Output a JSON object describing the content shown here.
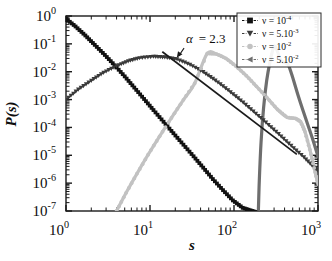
{
  "chart_data": {
    "type": "line",
    "title": "",
    "xlabel": "s",
    "ylabel": "P(s)",
    "xscale": "log",
    "yscale": "log",
    "xlim": [
      1,
      1000
    ],
    "ylim": [
      1e-07,
      1
    ],
    "grid": false,
    "xtick_labels": [
      "10",
      "10",
      "10",
      "10"
    ],
    "xtick_exponents": [
      "0",
      "1",
      "2",
      "3"
    ],
    "xtick_values": [
      1,
      10,
      100,
      1000
    ],
    "ytick_labels": [
      "10",
      "10",
      "10",
      "10",
      "10",
      "10",
      "10",
      "10"
    ],
    "ytick_exponents": [
      "0",
      "-1",
      "-2",
      "-3",
      "-4",
      "-5",
      "-6",
      "-7"
    ],
    "ytick_values": [
      1,
      0.1,
      0.01,
      0.001,
      0.0001,
      1e-05,
      1e-06,
      1e-07
    ],
    "legend_position": "top-right",
    "annotations": [
      {
        "text": "α = 2.3",
        "symbol": "α",
        "value": "2.3",
        "x": 30,
        "y": 0.09,
        "points_to_x": 20,
        "points_to_y": 0.028,
        "description": "power-law exponent of the decaying tail"
      }
    ],
    "series": [
      {
        "name": "ν = 10",
        "exponent": "-4",
        "label_prefix": "ν = 10",
        "marker": "filled-square",
        "color": "#111111",
        "x": [
          1,
          1.3,
          1.7,
          2.2,
          2.9,
          3.8,
          5,
          6.5,
          8.5,
          11,
          14.5,
          19,
          25,
          33,
          43,
          56,
          74,
          97,
          127,
          166,
          200,
          215
        ],
        "y": [
          0.8,
          0.42,
          0.2,
          0.092,
          0.04,
          0.017,
          0.0068,
          0.0027,
          0.00105,
          0.00042,
          0.00016,
          6.2e-05,
          2.4e-05,
          9.2e-06,
          3.6e-06,
          1.4e-06,
          5.6e-07,
          2.4e-07,
          1.3e-07,
          1e-07,
          8e-08,
          7e-08
        ]
      },
      {
        "name": "ν = 5.10",
        "exponent": "-3",
        "label_prefix": "ν = 5.10",
        "marker": "filled-triangle-down",
        "color": "#3a3a3a",
        "x": [
          1,
          1.4,
          2,
          2.8,
          4,
          5.5,
          7.5,
          11,
          15,
          21,
          30,
          43,
          60,
          85,
          120,
          170,
          240,
          340,
          480,
          680,
          900,
          1000
        ],
        "y": [
          0.001,
          0.0023,
          0.0048,
          0.0093,
          0.016,
          0.024,
          0.031,
          0.035,
          0.033,
          0.028,
          0.018,
          0.0098,
          0.0049,
          0.0022,
          0.00094,
          0.00038,
          0.00015,
          5.8e-05,
          2.2e-05,
          8.5e-06,
          3.6e-06,
          2.8e-06
        ]
      },
      {
        "name": "ν = 10",
        "exponent": "-2",
        "label_prefix": "ν = 10",
        "marker": "small-circle",
        "color": "#c2c2c2",
        "x": [
          4,
          5.2,
          7,
          9.5,
          13,
          18,
          25,
          34,
          48,
          62,
          80,
          105,
          140,
          185,
          245,
          330,
          430,
          540,
          620,
          700,
          800,
          900,
          1000
        ],
        "y": [
          1e-07,
          4.5e-07,
          2.2e-06,
          1.05e-05,
          4.8e-05,
          0.00022,
          0.00098,
          0.0038,
          0.045,
          0.043,
          0.03,
          0.016,
          0.0072,
          0.003,
          0.0012,
          0.00044,
          0.00023,
          0.00021,
          0.00016,
          7e-05,
          1.6e-05,
          3.5e-06,
          9e-07
        ]
      },
      {
        "name": "ν = 5.10",
        "exponent": "-2",
        "label_prefix": "ν = 5.10",
        "marker": "triangle-left",
        "color": "#6e6e6e",
        "x": [
          195,
          200,
          210,
          225,
          245,
          270,
          295,
          310,
          330,
          360,
          400,
          440,
          470,
          520,
          580,
          660,
          760,
          880,
          1000
        ],
        "y": [
          1e-07,
          1.2e-06,
          3e-05,
          0.0005,
          0.0048,
          0.025,
          0.072,
          0.08,
          0.052,
          0.026,
          0.021,
          0.018,
          0.011,
          0.0042,
          0.0014,
          0.00042,
          0.00012,
          3.2e-05,
          9e-06
        ]
      }
    ]
  },
  "legend": {
    "items": [
      {
        "label_prefix": "ν = 10",
        "exponent": "-4",
        "marker": "filled-square",
        "color": "#111111"
      },
      {
        "label_prefix": "ν = 5.10",
        "exponent": "-3",
        "marker": "filled-triangle-down",
        "color": "#3a3a3a"
      },
      {
        "label_prefix": "ν = 10",
        "exponent": "-2",
        "marker": "small-circle",
        "color": "#c2c2c2"
      },
      {
        "label_prefix": "ν = 5.10",
        "exponent": "-2",
        "marker": "triangle-left",
        "color": "#6e6e6e"
      }
    ]
  },
  "axes": {
    "x_title": "s",
    "y_title": "P(s)"
  }
}
